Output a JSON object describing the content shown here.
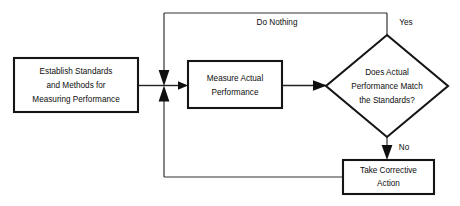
{
  "diagram": {
    "type": "flowchart",
    "colors": {
      "background": "#ffffff",
      "stroke": "#151515",
      "text": "#0d0d0d",
      "connector": "#222222"
    },
    "nodes": [
      {
        "id": "establish-standards",
        "shape": "rectangle",
        "lines": [
          "Establish Standards",
          "and Methods for",
          "Measuring Performance"
        ]
      },
      {
        "id": "measure-performance",
        "shape": "rectangle",
        "lines": [
          "Measure Actual",
          "Performance"
        ]
      },
      {
        "id": "decision-match",
        "shape": "diamond",
        "lines": [
          "Does Actual",
          "Performance Match",
          "the Standards?"
        ]
      },
      {
        "id": "corrective-action",
        "shape": "rectangle",
        "lines": [
          "Take Corrective",
          "Action"
        ]
      }
    ],
    "edge_labels": {
      "do_nothing": "Do Nothing",
      "yes": "Yes",
      "no": "No"
    }
  }
}
